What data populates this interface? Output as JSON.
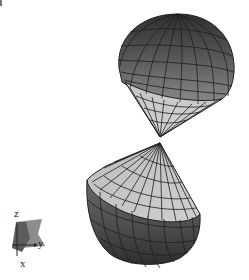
{
  "figure": {
    "colors": {
      "background": "#ffffff",
      "sphere_dark": "#3c3c3c",
      "sphere_mid": "#6e6e6e",
      "sphere_light": "#8c8c8c",
      "cone_light": "#c8c8c8",
      "grid_lines": "#1e1e1e"
    }
  },
  "axes_indicator": {
    "labels": {
      "z": "z",
      "y": "y",
      "x": "x"
    }
  }
}
